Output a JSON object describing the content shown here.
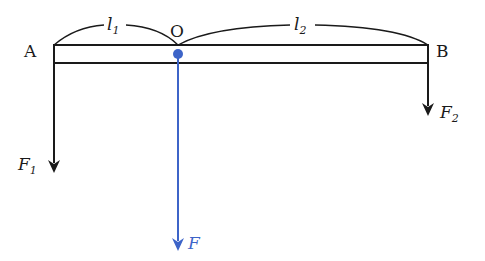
{
  "diagram": {
    "type": "lever",
    "colors": {
      "ink": "#1a1a1a",
      "accent": "#3d64c8",
      "background": "#ffffff"
    },
    "points": {
      "A": "A",
      "O": "O",
      "B": "B"
    },
    "lengths": {
      "l1": {
        "base": "l",
        "sub": "1"
      },
      "l2": {
        "base": "l",
        "sub": "2"
      }
    },
    "forces": {
      "F1": {
        "base": "F",
        "sub": "1",
        "direction": "down",
        "at": "A"
      },
      "F2": {
        "base": "F",
        "sub": "2",
        "direction": "down",
        "at": "B"
      },
      "F": {
        "base": "F",
        "sub": "",
        "direction": "down",
        "at": "O"
      }
    }
  }
}
